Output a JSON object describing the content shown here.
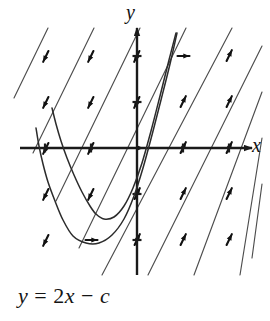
{
  "figure": {
    "kind": "slope-field-with-solution-curves",
    "caption": "y = 2x − c",
    "caption_parts": {
      "lhs": "y",
      "eq": " = ",
      "coef": "2",
      "var": "x",
      "minus": " − ",
      "const": "c"
    },
    "axis_x_label": "x",
    "axis_y_label": "y"
  },
  "chart_data": {
    "type": "scatter",
    "title": "",
    "subtitle": "",
    "xlabel": "x",
    "ylabel": "y",
    "xlim": [
      -2.55,
      2.5
    ],
    "ylim": [
      -2.8,
      2.7
    ],
    "grid": false,
    "legend": null,
    "annotations": [
      "y = 2x − c"
    ],
    "origin_px": [
      137,
      148
    ],
    "unit_px": 46,
    "axes": {
      "x_axis_px": {
        "x1": 20,
        "x2": 252,
        "y": 148,
        "arrow": "right"
      },
      "y_axis_px": {
        "y1": 28,
        "y2": 275,
        "x": 137,
        "arrow": "up"
      },
      "tick_len_px": 9,
      "x_ticks": [
        -2,
        -1,
        1,
        2
      ],
      "y_ticks": [
        -2,
        -1,
        1,
        2
      ]
    },
    "slope_field": {
      "equation": "dy/dx = 2x - c",
      "line_slope_px_dx_dy": [
        1,
        -2.05
      ],
      "comment": "parallel family of straight segments of constant slope; short arrowheads mark direction at lattice points",
      "segment_count": 9,
      "segments_px": [
        {
          "x1": 48,
          "y1": 28,
          "x2": 14,
          "y2": 98
        },
        {
          "x1": 94,
          "y1": 28,
          "x2": 33,
          "y2": 153
        },
        {
          "x1": 140,
          "y1": 28,
          "x2": 56,
          "y2": 201
        },
        {
          "x1": 186,
          "y1": 28,
          "x2": 79,
          "y2": 248
        },
        {
          "x1": 232,
          "y1": 28,
          "x2": 102,
          "y2": 275
        },
        {
          "x1": 262,
          "y1": 46,
          "x2": 148,
          "y2": 275
        },
        {
          "x1": 262,
          "y1": 92,
          "x2": 194,
          "y2": 275
        },
        {
          "x1": 262,
          "y1": 138,
          "x2": 240,
          "y2": 275
        },
        {
          "x1": 262,
          "y1": 184,
          "x2": 252,
          "y2": 258
        }
      ],
      "arrow_points_px": [
        {
          "x": 46,
          "y": 56,
          "dir": "down"
        },
        {
          "x": 46,
          "y": 102,
          "dir": "down"
        },
        {
          "x": 46,
          "y": 148,
          "dir": "down"
        },
        {
          "x": 46,
          "y": 194,
          "dir": "down"
        },
        {
          "x": 46,
          "y": 240,
          "dir": "down"
        },
        {
          "x": 91,
          "y": 56,
          "dir": "down"
        },
        {
          "x": 91,
          "y": 102,
          "dir": "down"
        },
        {
          "x": 91,
          "y": 148,
          "dir": "down"
        },
        {
          "x": 91,
          "y": 194,
          "dir": "down"
        },
        {
          "x": 91,
          "y": 240,
          "dir": "flat"
        },
        {
          "x": 137,
          "y": 56,
          "dir": "down"
        },
        {
          "x": 137,
          "y": 102,
          "dir": "down"
        },
        {
          "x": 137,
          "y": 148,
          "dir": "flat"
        },
        {
          "x": 137,
          "y": 194,
          "dir": "up"
        },
        {
          "x": 137,
          "y": 240,
          "dir": "up"
        },
        {
          "x": 183,
          "y": 56,
          "dir": "flat"
        },
        {
          "x": 183,
          "y": 102,
          "dir": "up"
        },
        {
          "x": 183,
          "y": 148,
          "dir": "up"
        },
        {
          "x": 183,
          "y": 194,
          "dir": "up"
        },
        {
          "x": 183,
          "y": 240,
          "dir": "up"
        },
        {
          "x": 229,
          "y": 56,
          "dir": "up"
        },
        {
          "x": 229,
          "y": 102,
          "dir": "up"
        },
        {
          "x": 229,
          "y": 148,
          "dir": "up"
        },
        {
          "x": 229,
          "y": 194,
          "dir": "up"
        },
        {
          "x": 229,
          "y": 240,
          "dir": "up"
        }
      ]
    },
    "solution_curves": [
      {
        "name": "parabola-inner",
        "vertex_px": [
          96,
          214
        ],
        "points_px": [
          [
            52,
            108
          ],
          [
            56,
            124
          ],
          [
            61,
            141
          ],
          [
            67,
            158
          ],
          [
            74,
            175
          ],
          [
            82,
            192
          ],
          [
            90,
            206
          ],
          [
            96,
            214
          ],
          [
            104,
            219
          ],
          [
            114,
            217
          ],
          [
            124,
            206
          ],
          [
            133,
            188
          ],
          [
            142,
            163
          ],
          [
            151,
            131
          ],
          [
            160,
            96
          ],
          [
            169,
            60
          ],
          [
            176,
            33
          ]
        ]
      },
      {
        "name": "parabola-outer",
        "vertex_px": [
          86,
          243
        ],
        "points_px": [
          [
            36,
            128
          ],
          [
            39,
            146
          ],
          [
            43,
            164
          ],
          [
            48,
            182
          ],
          [
            55,
            201
          ],
          [
            63,
            220
          ],
          [
            73,
            236
          ],
          [
            86,
            243
          ],
          [
            99,
            243
          ],
          [
            112,
            235
          ],
          [
            124,
            219
          ],
          [
            134,
            196
          ],
          [
            143,
            168
          ],
          [
            152,
            135
          ],
          [
            161,
            100
          ],
          [
            170,
            64
          ],
          [
            177,
            33
          ]
        ]
      }
    ]
  }
}
